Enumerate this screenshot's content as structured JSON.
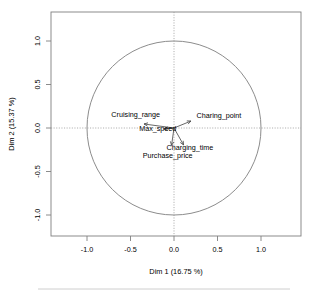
{
  "chart_data": {
    "type": "scatter",
    "title": "",
    "subtitle": "",
    "xlabel": "Dim 1 (16.75 %)",
    "ylabel": "Dim 2 (15.37 %)",
    "xlim": [
      -1.3,
      1.3
    ],
    "ylim": [
      -1.3,
      1.3
    ],
    "xticks": [
      "-1.0",
      "-0.5",
      "0.0",
      "0.5",
      "1.0"
    ],
    "xtick_values": [
      -1.0,
      -0.5,
      0.0,
      0.5,
      1.0
    ],
    "yticks": [
      "-1.0",
      "-0.5",
      "0.0",
      "0.5",
      "1.0"
    ],
    "ytick_values": [
      -1.0,
      -0.5,
      0.0,
      0.5,
      1.0
    ],
    "grid": false,
    "legend": "none",
    "unit_circle": true,
    "unit_circle_radius": 1.0,
    "dim1_variance_percent": 16.75,
    "dim2_variance_percent": 15.37,
    "variables": [
      {
        "name": "Cruising_range",
        "dim1": -0.345,
        "dim2": 0.046,
        "label_x": -0.72,
        "label_y": 0.125,
        "label_anchor": "start"
      },
      {
        "name": "Max_speed",
        "dim1": -0.115,
        "dim2": -0.011,
        "label_x": -0.4,
        "label_y": -0.035,
        "label_anchor": "start"
      },
      {
        "name": "Charing_point",
        "dim1": 0.195,
        "dim2": 0.08,
        "label_x": 0.26,
        "label_y": 0.115,
        "label_anchor": "start"
      },
      {
        "name": "Charging_time",
        "dim1": 0.11,
        "dim2": -0.195,
        "label_x": -0.085,
        "label_y": -0.255,
        "label_anchor": "start"
      },
      {
        "name": "Purchase_price",
        "dim1": -0.028,
        "dim2": -0.2,
        "label_x": -0.36,
        "label_y": -0.345,
        "label_anchor": "start"
      }
    ]
  },
  "axes": {
    "x_title": "Dim 1 (16.75 %)",
    "y_title": "Dim 2 (15.37 %)",
    "x_tick_labels": [
      "-1.0",
      "-0.5",
      "0.0",
      "0.5",
      "1.0"
    ],
    "y_tick_labels": [
      "-1.0",
      "-0.5",
      "0.0",
      "0.5",
      "1.0"
    ]
  },
  "colors": {
    "frame": "#7f7f7f",
    "circle": "#7f7f7f",
    "guide": "#9a9a9a",
    "arrow": "#4d4d4d",
    "text": "#000000",
    "background": "#ffffff",
    "footer_rule": "#c8c8c8"
  },
  "labels": {
    "var_0": "Cruising_range",
    "var_1": "Max_speed",
    "var_2": "Charing_point",
    "var_3": "Charging_time",
    "var_4": "Purchase_price",
    "xtick_0": "-1.0",
    "xtick_1": "-0.5",
    "xtick_2": "0.0",
    "xtick_3": "0.5",
    "xtick_4": "1.0",
    "ytick_0": "1.0",
    "ytick_1": "0.5",
    "ytick_2": "0.0",
    "ytick_3": "-0.5",
    "ytick_4": "-1.0"
  }
}
